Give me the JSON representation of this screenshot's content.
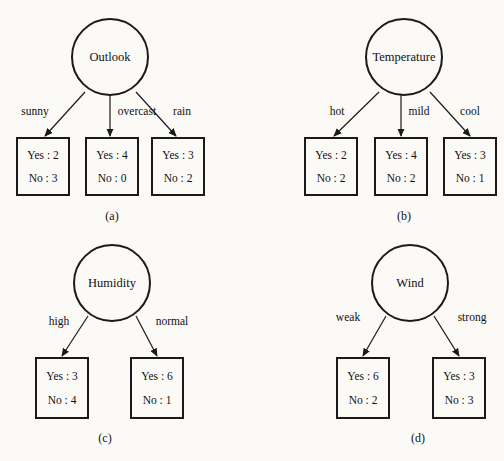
{
  "figure": {
    "background_color": "#fbfaf7",
    "ink_color": "#1a1a1a",
    "subfigures": [
      {
        "caption": "(a)",
        "caption_x": 112,
        "caption_y": 216,
        "root": {
          "label": "Outlook",
          "cx": 110,
          "cy": 57,
          "r": 38
        },
        "branches": [
          {
            "label": "sunny",
            "label_x": 35,
            "label_y": 112,
            "line": {
              "x1": 85,
              "y1": 92,
              "x2": 45,
              "y2": 136
            },
            "leaf": {
              "x": 17,
              "y": 138,
              "w": 52,
              "h": 57,
              "yes_label": "Yes : 2",
              "no_label": "No : 3"
            }
          },
          {
            "label": "overcast",
            "label_x": 137,
            "label_y": 112,
            "line": {
              "x1": 110,
              "y1": 95,
              "x2": 110,
              "y2": 136
            },
            "leaf": {
              "x": 86,
              "y": 138,
              "w": 52,
              "h": 57,
              "yes_label": "Yes : 4",
              "no_label": "No : 0"
            }
          },
          {
            "label": "rain",
            "label_x": 182,
            "label_y": 112,
            "line": {
              "x1": 136,
              "y1": 92,
              "x2": 176,
              "y2": 136
            },
            "leaf": {
              "x": 152,
              "y": 138,
              "w": 52,
              "h": 57,
              "yes_label": "Yes : 3",
              "no_label": "No : 2"
            }
          }
        ]
      },
      {
        "caption": "(b)",
        "caption_x": 404,
        "caption_y": 216,
        "root": {
          "label": "Temperature",
          "cx": 404,
          "cy": 57,
          "r": 38
        },
        "branches": [
          {
            "label": "hot",
            "label_x": 337,
            "label_y": 112,
            "line": {
              "x1": 379,
              "y1": 92,
              "x2": 334,
              "y2": 136
            },
            "leaf": {
              "x": 305,
              "y": 138,
              "w": 52,
              "h": 57,
              "yes_label": "Yes : 2",
              "no_label": "No : 2"
            }
          },
          {
            "label": "mild",
            "label_x": 419,
            "label_y": 112,
            "line": {
              "x1": 401,
              "y1": 95,
              "x2": 401,
              "y2": 136
            },
            "leaf": {
              "x": 375,
              "y": 138,
              "w": 52,
              "h": 57,
              "yes_label": "Yes : 4",
              "no_label": "No : 2"
            }
          },
          {
            "label": "cool",
            "label_x": 470,
            "label_y": 112,
            "line": {
              "x1": 430,
              "y1": 92,
              "x2": 470,
              "y2": 136
            },
            "leaf": {
              "x": 444,
              "y": 138,
              "w": 52,
              "h": 57,
              "yes_label": "Yes : 3",
              "no_label": "No : 1"
            }
          }
        ]
      },
      {
        "caption": "(c)",
        "caption_x": 105,
        "caption_y": 438,
        "root": {
          "label": "Humidity",
          "cx": 112,
          "cy": 283,
          "r": 38
        },
        "branches": [
          {
            "label": "high",
            "label_x": 59,
            "label_y": 322,
            "line": {
              "x1": 88,
              "y1": 316,
              "x2": 62,
              "y2": 356
            },
            "leaf": {
              "x": 36,
              "y": 358,
              "w": 52,
              "h": 60,
              "yes_label": "Yes : 3",
              "no_label": "No : 4"
            }
          },
          {
            "label": "normal",
            "label_x": 172,
            "label_y": 322,
            "line": {
              "x1": 136,
              "y1": 316,
              "x2": 157,
              "y2": 356
            },
            "leaf": {
              "x": 131,
              "y": 358,
              "w": 52,
              "h": 60,
              "yes_label": "Yes : 6",
              "no_label": "No : 1"
            }
          }
        ]
      },
      {
        "caption": "(d)",
        "caption_x": 418,
        "caption_y": 438,
        "root": {
          "label": "Wind",
          "cx": 410,
          "cy": 283,
          "r": 38
        },
        "branches": [
          {
            "label": "weak",
            "label_x": 348,
            "label_y": 318,
            "line": {
              "x1": 386,
              "y1": 316,
              "x2": 363,
              "y2": 356
            },
            "leaf": {
              "x": 337,
              "y": 358,
              "w": 52,
              "h": 60,
              "yes_label": "Yes : 6",
              "no_label": "No : 2"
            }
          },
          {
            "label": "strong",
            "label_x": 472,
            "label_y": 318,
            "line": {
              "x1": 434,
              "y1": 316,
              "x2": 459,
              "y2": 356
            },
            "leaf": {
              "x": 433,
              "y": 358,
              "w": 52,
              "h": 60,
              "yes_label": "Yes : 3",
              "no_label": "No : 3"
            }
          }
        ]
      }
    ]
  }
}
